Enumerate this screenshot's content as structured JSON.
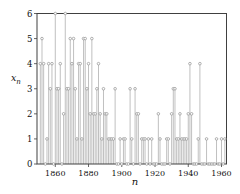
{
  "page": {
    "background": "#ffffff"
  },
  "chart_data": {
    "type": "scatter",
    "subtype": "stem-plot-with-open-circle-markers",
    "title": "",
    "xlabel": "n",
    "ylabel": "x_n",
    "ylabel_base": "x",
    "ylabel_sub": "n",
    "x": [
      1851,
      1852,
      1853,
      1854,
      1855,
      1856,
      1857,
      1858,
      1859,
      1860,
      1861,
      1862,
      1863,
      1864,
      1865,
      1866,
      1867,
      1868,
      1869,
      1870,
      1871,
      1872,
      1873,
      1874,
      1875,
      1876,
      1877,
      1878,
      1879,
      1880,
      1881,
      1882,
      1883,
      1884,
      1885,
      1886,
      1887,
      1888,
      1889,
      1890,
      1891,
      1892,
      1893,
      1894,
      1895,
      1896,
      1897,
      1898,
      1899,
      1900,
      1901,
      1902,
      1903,
      1904,
      1905,
      1906,
      1907,
      1908,
      1909,
      1910,
      1911,
      1912,
      1913,
      1914,
      1915,
      1916,
      1917,
      1918,
      1919,
      1920,
      1921,
      1922,
      1923,
      1924,
      1925,
      1926,
      1927,
      1928,
      1929,
      1930,
      1931,
      1932,
      1933,
      1934,
      1935,
      1936,
      1937,
      1938,
      1939,
      1940,
      1941,
      1942,
      1943,
      1944,
      1945,
      1946,
      1947,
      1948,
      1949,
      1950,
      1951,
      1952,
      1953,
      1954,
      1955,
      1956,
      1957,
      1958,
      1959,
      1960,
      1961,
      1962
    ],
    "y": [
      4,
      5,
      4,
      0,
      1,
      4,
      3,
      4,
      0,
      6,
      3,
      3,
      4,
      0,
      2,
      6,
      3,
      3,
      5,
      4,
      5,
      3,
      1,
      4,
      4,
      1,
      5,
      5,
      3,
      4,
      2,
      5,
      2,
      2,
      3,
      4,
      2,
      1,
      3,
      2,
      2,
      1,
      1,
      1,
      1,
      3,
      0,
      0,
      1,
      0,
      1,
      1,
      0,
      0,
      3,
      1,
      0,
      3,
      2,
      2,
      0,
      1,
      1,
      1,
      0,
      1,
      0,
      1,
      0,
      0,
      0,
      2,
      1,
      0,
      0,
      0,
      1,
      1,
      0,
      2,
      3,
      3,
      1,
      1,
      2,
      1,
      1,
      1,
      1,
      2,
      4,
      2,
      0,
      0,
      0,
      1,
      4,
      0,
      0,
      0,
      1,
      0,
      0,
      0,
      0,
      0,
      1,
      0,
      0,
      1,
      0,
      1
    ],
    "x_ticks": [
      1860,
      1880,
      1900,
      1920,
      1940,
      1960
    ],
    "y_ticks": [
      0,
      1,
      2,
      3,
      4,
      5,
      6
    ],
    "xlim": [
      1849,
      1963
    ],
    "ylim": [
      0,
      6
    ],
    "grid": false,
    "legend": "none",
    "marker": "open-circle",
    "colors": {
      "stem": "#b0b0b0",
      "marker_stroke": "#8f8f8f",
      "marker_fill": "#ffffff",
      "frame": "#404040",
      "tick": "#404040",
      "text": "#111111",
      "background": "#ffffff"
    }
  }
}
